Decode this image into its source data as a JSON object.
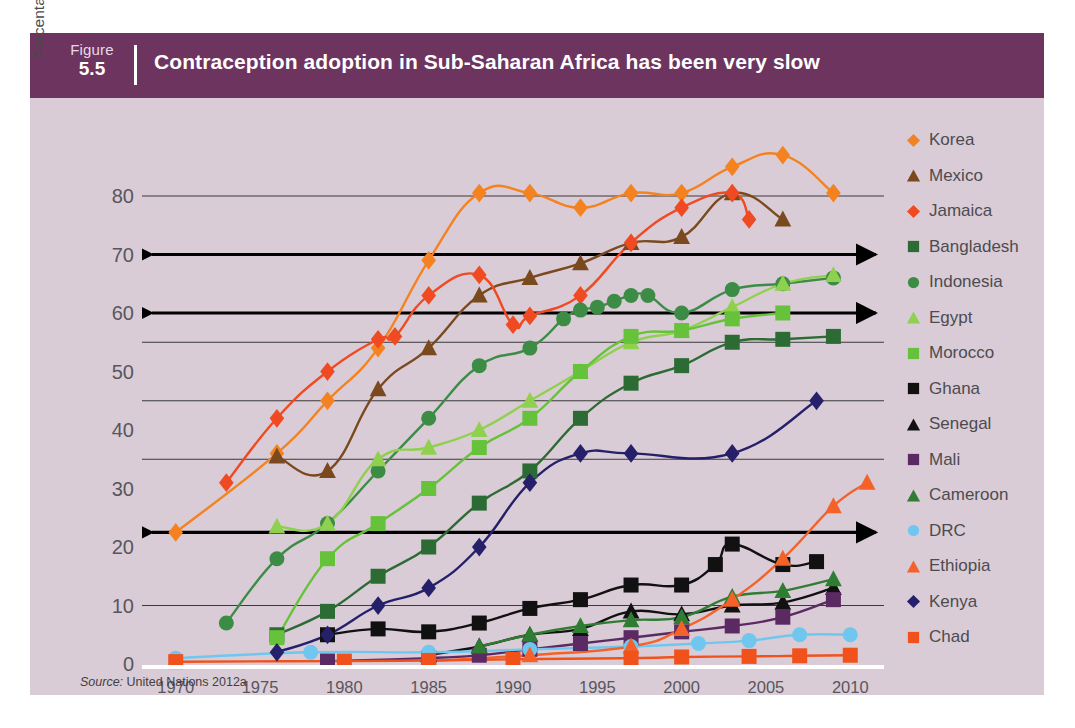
{
  "figure": {
    "label_word": "Figure",
    "number": "5.5",
    "title": "Contraception adoption in Sub-Saharan Africa has been very slow",
    "header_color": "#6d3460",
    "panel_color": "#d9ccd6",
    "source_prefix": "Source:",
    "source_text": "United Nations 2012a"
  },
  "chart_data": {
    "type": "line",
    "title": "Contraception adoption in Sub-Saharan Africa has been very slow",
    "xlabel": "",
    "ylabel": "Percentage of women in union using a modern contreceptive method",
    "ylabel_line1": "Percentage of women in union using a modern",
    "ylabel_line2": "contreceptive method",
    "xlim": [
      1968,
      2012
    ],
    "ylim": [
      0,
      86
    ],
    "yticks": [
      0,
      10,
      20,
      30,
      40,
      50,
      60,
      70,
      80
    ],
    "xticks": [
      1970,
      1975,
      1980,
      1985,
      1990,
      1995,
      2000,
      2005,
      2010
    ],
    "gridlines": [
      10,
      22.5,
      35,
      45,
      55,
      60,
      70,
      80
    ],
    "arrow_lines": [
      70,
      60,
      22.5
    ],
    "baseline_color": "#ffffff",
    "grid": true,
    "legend_position": "right",
    "series": [
      {
        "name": "Korea",
        "color": "#f58220",
        "marker": "diamond",
        "points": [
          [
            1970,
            22.5
          ],
          [
            1976,
            36
          ],
          [
            1979,
            45
          ],
          [
            1982,
            54
          ],
          [
            1985,
            69
          ],
          [
            1988,
            80.5
          ],
          [
            1991,
            80.5
          ],
          [
            1994,
            78
          ],
          [
            1997,
            80.5
          ],
          [
            2000,
            80.5
          ],
          [
            2003,
            85
          ],
          [
            2006,
            87
          ],
          [
            2009,
            80.5
          ]
        ]
      },
      {
        "name": "Mexico",
        "color": "#7a4a1e",
        "marker": "triangle",
        "points": [
          [
            1976,
            35.5
          ],
          [
            1979,
            33
          ],
          [
            1982,
            47
          ],
          [
            1985,
            54
          ],
          [
            1988,
            63
          ],
          [
            1991,
            66
          ],
          [
            1994,
            68.5
          ],
          [
            1997,
            72
          ],
          [
            2000,
            73
          ],
          [
            2003,
            80.5
          ],
          [
            2006,
            76
          ]
        ]
      },
      {
        "name": "Jamaica",
        "color": "#ef4a22",
        "marker": "diamond",
        "points": [
          [
            1973,
            31
          ],
          [
            1976,
            42
          ],
          [
            1979,
            50
          ],
          [
            1982,
            55.5
          ],
          [
            1983,
            56
          ],
          [
            1985,
            63
          ],
          [
            1988,
            66.5
          ],
          [
            1990,
            58
          ],
          [
            1991,
            59.5
          ],
          [
            1994,
            63
          ],
          [
            1997,
            72
          ],
          [
            2000,
            78
          ],
          [
            2003,
            80.5
          ],
          [
            2004,
            76
          ]
        ]
      },
      {
        "name": "Bangladesh",
        "color": "#2d6b35",
        "marker": "square",
        "points": [
          [
            1976,
            5
          ],
          [
            1979,
            9
          ],
          [
            1982,
            15
          ],
          [
            1985,
            20
          ],
          [
            1988,
            27.5
          ],
          [
            1991,
            33
          ],
          [
            1994,
            42
          ],
          [
            1997,
            48
          ],
          [
            2000,
            51
          ],
          [
            2003,
            55
          ],
          [
            2006,
            55.5
          ],
          [
            2009,
            56
          ]
        ]
      },
      {
        "name": "Indonesia",
        "color": "#3c8c46",
        "marker": "circle",
        "points": [
          [
            1973,
            7
          ],
          [
            1976,
            18
          ],
          [
            1979,
            24
          ],
          [
            1982,
            33
          ],
          [
            1985,
            42
          ],
          [
            1988,
            51
          ],
          [
            1991,
            54
          ],
          [
            1993,
            59
          ],
          [
            1994,
            60.5
          ],
          [
            1995,
            61
          ],
          [
            1996,
            62
          ],
          [
            1997,
            63
          ],
          [
            1998,
            63
          ],
          [
            2000,
            60
          ],
          [
            2003,
            64
          ],
          [
            2006,
            65
          ],
          [
            2009,
            66
          ]
        ]
      },
      {
        "name": "Egypt",
        "color": "#8fd14f",
        "marker": "triangle",
        "points": [
          [
            1976,
            23.5
          ],
          [
            1979,
            24
          ],
          [
            1982,
            35
          ],
          [
            1985,
            37
          ],
          [
            1988,
            40
          ],
          [
            1991,
            45
          ],
          [
            1994,
            50
          ],
          [
            1997,
            55
          ],
          [
            2000,
            57
          ],
          [
            2003,
            61
          ],
          [
            2006,
            65
          ],
          [
            2009,
            66.5
          ]
        ]
      },
      {
        "name": "Morocco",
        "color": "#66c23a",
        "marker": "square",
        "points": [
          [
            1976,
            4.5
          ],
          [
            1979,
            18
          ],
          [
            1982,
            24
          ],
          [
            1985,
            30
          ],
          [
            1988,
            37
          ],
          [
            1991,
            42
          ],
          [
            1994,
            50
          ],
          [
            1997,
            56
          ],
          [
            2000,
            57
          ],
          [
            2003,
            59
          ],
          [
            2006,
            60
          ]
        ]
      },
      {
        "name": "Ghana",
        "color": "#111111",
        "marker": "square",
        "points": [
          [
            1979,
            5
          ],
          [
            1982,
            6
          ],
          [
            1985,
            5.5
          ],
          [
            1988,
            7
          ],
          [
            1991,
            9.5
          ],
          [
            1994,
            11
          ],
          [
            1997,
            13.5
          ],
          [
            2000,
            13.5
          ],
          [
            2002,
            17
          ],
          [
            2003,
            20.5
          ],
          [
            2006,
            17
          ],
          [
            2008,
            17.5
          ]
        ]
      },
      {
        "name": "Senegal",
        "color": "#111111",
        "marker": "triangle",
        "points": [
          [
            1985,
            1.5
          ],
          [
            1988,
            3
          ],
          [
            1991,
            5
          ],
          [
            1994,
            6
          ],
          [
            1997,
            9
          ],
          [
            2000,
            8.5
          ],
          [
            2003,
            10
          ],
          [
            2006,
            10.5
          ],
          [
            2009,
            13
          ]
        ]
      },
      {
        "name": "Mali",
        "color": "#5b2a63",
        "marker": "square",
        "points": [
          [
            1979,
            0.5
          ],
          [
            1985,
            1
          ],
          [
            1988,
            1.5
          ],
          [
            1991,
            2.5
          ],
          [
            1994,
            3.5
          ],
          [
            1997,
            4.5
          ],
          [
            2000,
            5.5
          ],
          [
            2003,
            6.5
          ],
          [
            2006,
            8
          ],
          [
            2009,
            11
          ]
        ]
      },
      {
        "name": "Cameroon",
        "color": "#2f7d32",
        "marker": "triangle",
        "points": [
          [
            1988,
            3
          ],
          [
            1991,
            5
          ],
          [
            1994,
            6.5
          ],
          [
            1997,
            7.5
          ],
          [
            2000,
            8
          ],
          [
            2003,
            11.5
          ],
          [
            2006,
            12.5
          ],
          [
            2009,
            14.5
          ]
        ]
      },
      {
        "name": "DRC",
        "color": "#6fc7ef",
        "marker": "circle",
        "points": [
          [
            1970,
            1
          ],
          [
            1978,
            2
          ],
          [
            1985,
            2
          ],
          [
            1991,
            2.5
          ],
          [
            1997,
            3
          ],
          [
            2001,
            3.5
          ],
          [
            2004,
            4
          ],
          [
            2007,
            5
          ],
          [
            2010,
            5
          ]
        ]
      },
      {
        "name": "Ethiopia",
        "color": "#f4622a",
        "marker": "triangle",
        "points": [
          [
            1985,
            0.5
          ],
          [
            1991,
            1.5
          ],
          [
            1997,
            3
          ],
          [
            2000,
            6
          ],
          [
            2003,
            11
          ],
          [
            2006,
            18
          ],
          [
            2009,
            27
          ],
          [
            2011,
            31
          ]
        ]
      },
      {
        "name": "Kenya",
        "color": "#26206b",
        "marker": "diamond",
        "points": [
          [
            1976,
            2
          ],
          [
            1979,
            5
          ],
          [
            1982,
            10
          ],
          [
            1985,
            13
          ],
          [
            1988,
            20
          ],
          [
            1991,
            31
          ],
          [
            1994,
            36
          ],
          [
            1997,
            36
          ],
          [
            2003,
            36
          ],
          [
            2008,
            45
          ]
        ]
      },
      {
        "name": "Chad",
        "color": "#f1521c",
        "marker": "square",
        "points": [
          [
            1970,
            0.4
          ],
          [
            1980,
            0.5
          ],
          [
            1985,
            0.6
          ],
          [
            1990,
            0.8
          ],
          [
            1997,
            1
          ],
          [
            2000,
            1.2
          ],
          [
            2004,
            1.3
          ],
          [
            2007,
            1.4
          ],
          [
            2010,
            1.5
          ]
        ]
      }
    ]
  },
  "legend": {
    "items": [
      {
        "label": "Korea",
        "color": "#f58220",
        "marker": "diamond"
      },
      {
        "label": "Mexico",
        "color": "#7a4a1e",
        "marker": "triangle"
      },
      {
        "label": "Jamaica",
        "color": "#ef4a22",
        "marker": "diamond"
      },
      {
        "label": "Bangladesh",
        "color": "#2d6b35",
        "marker": "square"
      },
      {
        "label": "Indonesia",
        "color": "#3c8c46",
        "marker": "circle"
      },
      {
        "label": "Egypt",
        "color": "#8fd14f",
        "marker": "triangle"
      },
      {
        "label": "Morocco",
        "color": "#66c23a",
        "marker": "square"
      },
      {
        "label": "Ghana",
        "color": "#111111",
        "marker": "square"
      },
      {
        "label": "Senegal",
        "color": "#111111",
        "marker": "triangle"
      },
      {
        "label": "Mali",
        "color": "#5b2a63",
        "marker": "square"
      },
      {
        "label": "Cameroon",
        "color": "#2f7d32",
        "marker": "triangle"
      },
      {
        "label": "DRC",
        "color": "#6fc7ef",
        "marker": "circle"
      },
      {
        "label": "Ethiopia",
        "color": "#f4622a",
        "marker": "triangle"
      },
      {
        "label": "Kenya",
        "color": "#26206b",
        "marker": "diamond"
      },
      {
        "label": "Chad",
        "color": "#f1521c",
        "marker": "square"
      }
    ]
  }
}
